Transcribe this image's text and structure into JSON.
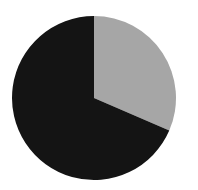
{
  "chart_data": {
    "type": "pie",
    "title": "",
    "categories": [
      "Slice A",
      "Slice B"
    ],
    "values": [
      31.5,
      68.5
    ],
    "colors": [
      "#a6a6a6",
      "#141414"
    ],
    "start_angle_deg": 0,
    "direction": "clockwise",
    "legend": "none",
    "labels_shown": false
  },
  "layout": {
    "cx": 94,
    "cy": 98,
    "r": 82,
    "background": "#ffffff"
  }
}
